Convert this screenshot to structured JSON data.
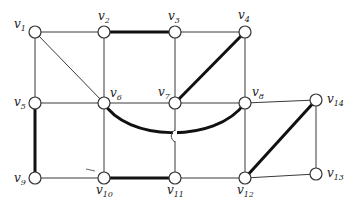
{
  "diagram": {
    "type": "graph",
    "node_radius": 6,
    "nodes": [
      {
        "id": "v1",
        "name": "v",
        "sub": "1",
        "x": 35,
        "y": 32,
        "lx": 14,
        "ly": 28
      },
      {
        "id": "v2",
        "name": "v",
        "sub": "2",
        "x": 104,
        "y": 32,
        "lx": 98,
        "ly": 20
      },
      {
        "id": "v3",
        "name": "v",
        "sub": "3",
        "x": 175,
        "y": 32,
        "lx": 168,
        "ly": 20
      },
      {
        "id": "v4",
        "name": "v",
        "sub": "4",
        "x": 245,
        "y": 32,
        "lx": 238,
        "ly": 19
      },
      {
        "id": "v5",
        "name": "v",
        "sub": "5",
        "x": 35,
        "y": 103,
        "lx": 14,
        "ly": 106
      },
      {
        "id": "v6",
        "name": "v",
        "sub": "6",
        "x": 104,
        "y": 103,
        "lx": 110,
        "ly": 97
      },
      {
        "id": "v7",
        "name": "v",
        "sub": "7",
        "x": 175,
        "y": 103,
        "lx": 158,
        "ly": 96
      },
      {
        "id": "v8",
        "name": "v",
        "sub": "8",
        "x": 245,
        "y": 103,
        "lx": 252,
        "ly": 96
      },
      {
        "id": "v9",
        "name": "v",
        "sub": "9",
        "x": 35,
        "y": 178,
        "lx": 14,
        "ly": 182
      },
      {
        "id": "v10",
        "name": "v",
        "sub": "10",
        "x": 104,
        "y": 178,
        "lx": 96,
        "ly": 194
      },
      {
        "id": "v11",
        "name": "v",
        "sub": "11",
        "x": 175,
        "y": 178,
        "lx": 167,
        "ly": 194
      },
      {
        "id": "v12",
        "name": "v",
        "sub": "12",
        "x": 245,
        "y": 178,
        "lx": 237,
        "ly": 194
      },
      {
        "id": "v13",
        "name": "v",
        "sub": "13",
        "x": 316,
        "y": 174,
        "lx": 327,
        "ly": 177
      },
      {
        "id": "v14",
        "name": "v",
        "sub": "14",
        "x": 316,
        "y": 100,
        "lx": 327,
        "ly": 103
      }
    ],
    "edges": [
      {
        "from": "v1",
        "to": "v2",
        "bold": false
      },
      {
        "from": "v2",
        "to": "v3",
        "bold": true
      },
      {
        "from": "v3",
        "to": "v4",
        "bold": false
      },
      {
        "from": "v1",
        "to": "v5",
        "bold": false
      },
      {
        "from": "v1",
        "to": "v6",
        "bold": false
      },
      {
        "from": "v2",
        "to": "v6",
        "bold": false
      },
      {
        "from": "v3",
        "to": "v7",
        "bold": false
      },
      {
        "from": "v4",
        "to": "v7",
        "bold": true
      },
      {
        "from": "v4",
        "to": "v8",
        "bold": false
      },
      {
        "from": "v5",
        "to": "v6",
        "bold": false
      },
      {
        "from": "v6",
        "to": "v7",
        "bold": false
      },
      {
        "from": "v7",
        "to": "v8",
        "bold": false
      },
      {
        "from": "v8",
        "to": "v14",
        "bold": false
      },
      {
        "from": "v5",
        "to": "v9",
        "bold": true
      },
      {
        "from": "v6",
        "to": "v10",
        "bold": false
      },
      {
        "from": "v7",
        "to": "v11",
        "bold": false
      },
      {
        "from": "v8",
        "to": "v12",
        "bold": false
      },
      {
        "from": "v14",
        "to": "v13",
        "bold": false
      },
      {
        "from": "v9",
        "to": "v10",
        "bold": false
      },
      {
        "from": "v10",
        "to": "v11",
        "bold": true
      },
      {
        "from": "v11",
        "to": "v12",
        "bold": false
      },
      {
        "from": "v12",
        "to": "v13",
        "bold": false
      },
      {
        "from": "v12",
        "to": "v14",
        "bold": true
      }
    ],
    "curved_edges": [
      {
        "from": "v6",
        "to": "v8",
        "bold": true,
        "path": "M104,103 C125,140 215,145 245,103",
        "crosses_with_bridge": "v7-v11"
      }
    ],
    "bridge_mark": {
      "x": 175,
      "y": 136
    },
    "stray_mark": {
      "x1": 86,
      "y1": 169,
      "x2": 95,
      "y2": 171
    }
  }
}
